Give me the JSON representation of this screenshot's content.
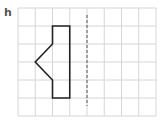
{
  "exercise": {
    "label": "h"
  },
  "grid": {
    "origin_x": 18,
    "origin_y": 8,
    "cols": 8,
    "rows": 6,
    "cell_w": 17.25,
    "cell_h": 18,
    "line_color": "#d6d6d6"
  },
  "shape": {
    "stroke_color": "#222222",
    "vertices_grid": [
      [
        2,
        1
      ],
      [
        3,
        1
      ],
      [
        3,
        5
      ],
      [
        2,
        5
      ],
      [
        2,
        4
      ],
      [
        1,
        3
      ],
      [
        2,
        2
      ]
    ]
  },
  "mirror_line": {
    "style": "dashed",
    "color": "#555555",
    "grid_col": 4,
    "y_start": 15,
    "y_end": 106
  }
}
